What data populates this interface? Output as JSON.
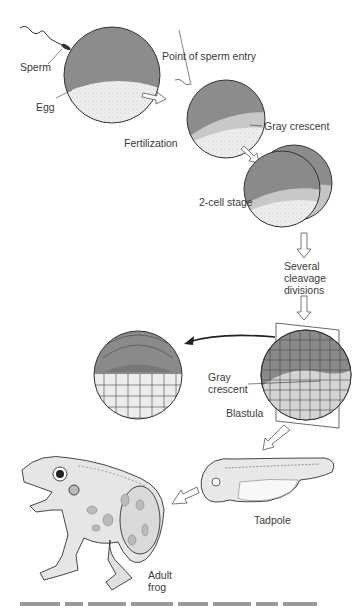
{
  "diagram": {
    "labels": {
      "sperm": "Sperm",
      "egg": "Egg",
      "point_of_sperm_entry": "Point of sperm entry",
      "fertilization": "Fertilization",
      "gray_crescent_top": "Gray crescent",
      "two_cell_stage": "2-cell stage",
      "cleavage_line1": "Several",
      "cleavage_line2": "cleavage",
      "cleavage_line3": "divisions",
      "gray_crescent_blastula_line1": "Gray",
      "gray_crescent_blastula_line2": "crescent",
      "blastula": "Blastula",
      "tadpole": "Tadpole",
      "adult_frog_line1": "Adult",
      "adult_frog_line2": "frog"
    },
    "stages": [
      "Egg + Sperm",
      "Fertilization",
      "2-cell stage",
      "Several cleavage divisions",
      "Blastula",
      "Tadpole",
      "Adult frog"
    ],
    "colors": {
      "animal_pole": "#8a8a8a",
      "vegetal_pole": "#e6e6e6",
      "gray_crescent": "#c4c4c4",
      "outline": "#333333",
      "arrow_fill": "#ffffff"
    },
    "caption": "(caption text cut off at bottom edge — illegible)"
  }
}
